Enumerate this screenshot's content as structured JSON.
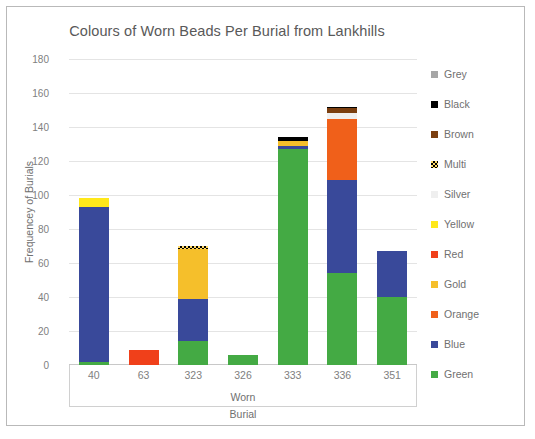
{
  "chart_data": {
    "type": "bar",
    "stacked": true,
    "title": "Colours of Worn Beads Per Burial from Lankhills",
    "xlabel_lines": [
      "Worn",
      "Burial"
    ],
    "ylabel": "Frequencey of Burials",
    "categories": [
      "40",
      "63",
      "323",
      "326",
      "333",
      "336",
      "351"
    ],
    "ylim": [
      0,
      180
    ],
    "yticks": [
      0,
      20,
      40,
      60,
      80,
      100,
      120,
      140,
      160,
      180
    ],
    "grid": true,
    "legend_position": "right",
    "series": [
      {
        "name": "Green",
        "color": "#44aa44",
        "values": [
          2,
          0,
          14,
          6,
          127,
          54,
          40
        ]
      },
      {
        "name": "Blue",
        "color": "#39499a",
        "values": [
          91,
          0,
          25,
          0,
          2,
          55,
          27
        ]
      },
      {
        "name": "Orange",
        "color": "#f0601a",
        "values": [
          0,
          0,
          0,
          0,
          0,
          36,
          0
        ]
      },
      {
        "name": "Gold",
        "color": "#f5bf2b",
        "values": [
          0,
          0,
          29,
          0,
          3,
          0,
          0
        ]
      },
      {
        "name": "Red",
        "color": "#f0401a",
        "values": [
          0,
          9,
          0,
          0,
          0,
          0,
          0
        ]
      },
      {
        "name": "Yellow",
        "color": "#ffe81a",
        "values": [
          5,
          0,
          0,
          0,
          0,
          0,
          0
        ]
      },
      {
        "name": "Silver",
        "color": "#efefef",
        "values": [
          0,
          0,
          0,
          0,
          0,
          3,
          0
        ]
      },
      {
        "name": "Multi",
        "color": "#ffd966",
        "values": [
          0,
          0,
          2,
          0,
          0,
          0,
          0
        ]
      },
      {
        "name": "Brown",
        "color": "#7b3f10",
        "values": [
          0,
          0,
          0,
          0,
          0,
          3,
          0
        ]
      },
      {
        "name": "Black",
        "color": "#000000",
        "values": [
          0,
          0,
          0,
          0,
          2,
          1,
          0
        ]
      },
      {
        "name": "Grey",
        "color": "#a6a6a6",
        "values": [
          0,
          0,
          0,
          0,
          0,
          0,
          0
        ]
      }
    ],
    "totals": [
      98,
      9,
      70,
      6,
      134,
      152,
      67
    ],
    "legend_order": [
      "Grey",
      "Black",
      "Brown",
      "Multi",
      "Silver",
      "Yellow",
      "Red",
      "Gold",
      "Orange",
      "Blue",
      "Green"
    ]
  }
}
